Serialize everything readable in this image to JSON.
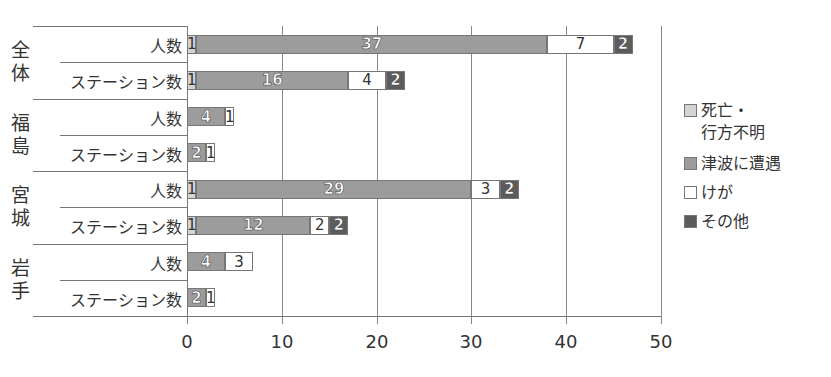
{
  "chart_data": {
    "type": "bar",
    "orientation": "horizontal",
    "stacked": true,
    "title": "",
    "xlabel": "",
    "ylabel": "",
    "xlim": [
      0,
      50
    ],
    "x_ticks": [
      0,
      10,
      20,
      30,
      40,
      50
    ],
    "grid": "vertical",
    "legend_position": "right",
    "groups": [
      {
        "label": "全体",
        "rows": [
          {
            "label": "人数",
            "values": [
              1,
              37,
              7,
              2
            ]
          },
          {
            "label": "ステーション数",
            "values": [
              1,
              16,
              4,
              2
            ]
          }
        ]
      },
      {
        "label": "福島",
        "rows": [
          {
            "label": "人数",
            "values": [
              0,
              4,
              1,
              0
            ]
          },
          {
            "label": "ステーション数",
            "values": [
              0,
              2,
              1,
              0
            ]
          }
        ]
      },
      {
        "label": "宮城",
        "rows": [
          {
            "label": "人数",
            "values": [
              1,
              29,
              3,
              2
            ]
          },
          {
            "label": "ステーション数",
            "values": [
              1,
              12,
              2,
              2
            ]
          }
        ]
      },
      {
        "label": "岩手",
        "rows": [
          {
            "label": "人数",
            "values": [
              0,
              4,
              3,
              0
            ]
          },
          {
            "label": "ステーション数",
            "values": [
              0,
              2,
              1,
              0
            ]
          }
        ]
      }
    ],
    "series": [
      {
        "name": "死亡・行方不明",
        "color": "#d4d4d4"
      },
      {
        "name": "津波に遭遇",
        "color": "#9c9c9c"
      },
      {
        "name": "けが",
        "color": "#ffffff"
      },
      {
        "name": "その他",
        "color": "#5c5c5c"
      }
    ]
  },
  "legend": {
    "items": [
      {
        "line1": "死亡・",
        "line2": "行方不明"
      },
      {
        "line1": "津波に遭遇"
      },
      {
        "line1": "けが"
      },
      {
        "line1": "その他"
      }
    ]
  }
}
